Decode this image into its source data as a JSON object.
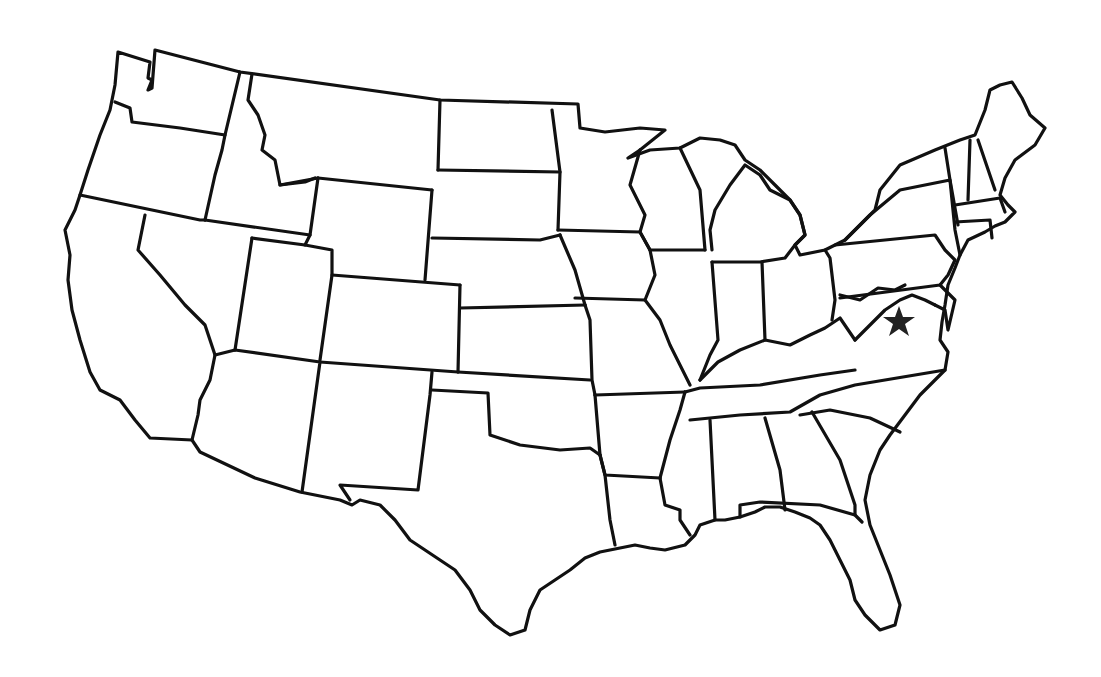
{
  "map": {
    "title": "Outline map of the contiguous United States",
    "style": "blank state outlines, no labels",
    "stroke_color": "#111111",
    "background_color": "#ffffff",
    "marker": {
      "type": "star",
      "color": "#222222",
      "approx_location": "northern Virginia / Washington D.C. area",
      "x": 899,
      "y": 321
    }
  }
}
